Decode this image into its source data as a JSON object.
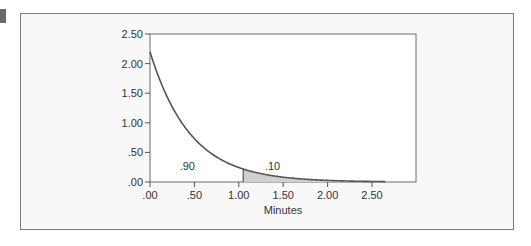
{
  "chart_data": {
    "type": "area",
    "title": "",
    "xlabel": "Minutes",
    "ylabel": "",
    "xlim": [
      0,
      2.65
    ],
    "ylim": [
      0,
      2.5
    ],
    "grid": false,
    "legend": null,
    "x_ticks": [
      ".00",
      ".50",
      "1.00",
      "1.50",
      "2.00",
      "2.50"
    ],
    "x_tick_values": [
      0,
      0.5,
      1.0,
      1.5,
      2.0,
      2.5
    ],
    "y_ticks": [
      ".00",
      ".50",
      "1.00",
      "1.50",
      "2.00",
      "2.50"
    ],
    "y_tick_values": [
      0,
      0.5,
      1.0,
      1.5,
      2.0,
      2.5
    ],
    "series": [
      {
        "name": "Exponential density",
        "function": "2.2*exp(-2.2*x)",
        "rate": 2.2,
        "x": [
          0,
          0.25,
          0.5,
          0.75,
          1.0,
          1.05,
          1.25,
          1.5,
          1.75,
          2.0,
          2.25,
          2.5,
          2.65
        ],
        "values": [
          2.2,
          1.27,
          0.73,
          0.42,
          0.24,
          0.22,
          0.14,
          0.08,
          0.05,
          0.03,
          0.02,
          0.01,
          0.006
        ]
      }
    ],
    "shaded_region": {
      "from": 1.05,
      "to": 2.65,
      "color": "#d0d0d0"
    },
    "annotations": [
      {
        "text": ".90",
        "x": 0.42,
        "y": 0.27
      },
      {
        "text": ".10",
        "x": 1.38,
        "y": 0.27
      }
    ]
  },
  "colors": {
    "panel_bg": "#f8f8f8",
    "plot_bg": "#ffffff",
    "axis": "#555555",
    "curve": "#555555",
    "shade": "#d0d0d0",
    "marker": "#6b6b6b"
  }
}
